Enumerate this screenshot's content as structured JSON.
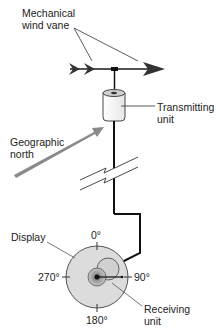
{
  "labels": {
    "wind_vane_line1": "Mechanical",
    "wind_vane_line2": "wind vane",
    "transmitter_line1": "Transmitting",
    "transmitter_line2": "unit",
    "north_line1": "Geographic",
    "north_line2": "north",
    "display": "Display",
    "receiver_line1": "Receiving",
    "receiver_line2": "unit"
  },
  "compass": {
    "north": "0°",
    "east": "90°",
    "south": "180°",
    "west": "270°"
  },
  "colors": {
    "line": "#1a1a1a",
    "north_arrow": "#8a8a8a",
    "dial_fill": "#dcdcdc",
    "dial_stroke": "#555555",
    "receiver_fill": "#b8b8b8",
    "text": "#222222"
  }
}
